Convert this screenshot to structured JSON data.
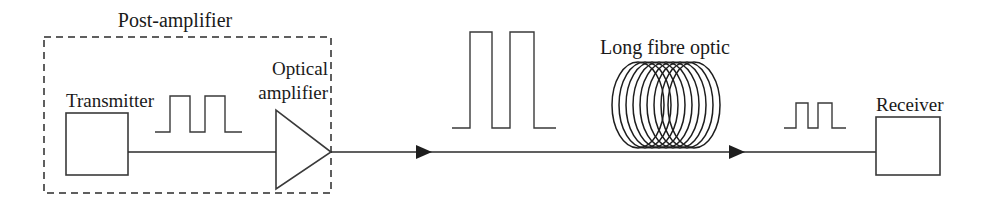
{
  "diagram": {
    "background_color": "#ffffff",
    "line_color": "#2b2b2b",
    "text_color": "#1a1a1a",
    "labels": {
      "post_amplifier": "Post-amplifier",
      "transmitter": "Transmitter",
      "optical_amplifier_line1": "Optical",
      "optical_amplifier_line2": "amplifier",
      "long_fibre_optic": "Long fibre optic",
      "receiver": "Receiver"
    },
    "components": {
      "enclosure": {
        "name": "post-amplifier-boundary",
        "style": "dashed",
        "x": 44,
        "y": 37,
        "width": 287,
        "height": 156
      },
      "transmitter_box": {
        "x": 66,
        "y": 113,
        "width": 62,
        "height": 62
      },
      "amplifier_triangle": {
        "x1": 276,
        "y1": 110,
        "x2": 276,
        "y2": 189,
        "tip_x": 331,
        "tip_y": 152
      },
      "receiver_box": {
        "x": 876,
        "y": 117,
        "width": 64,
        "height": 58
      },
      "fibre_coil": {
        "center_x": 665,
        "center_y": 105,
        "ring_count": 8,
        "ring_rx": 26,
        "ring_ry": 43,
        "spread": 54
      }
    },
    "signal_traces": [
      {
        "name": "input-pulse-train",
        "description": "Low amplitude two-pulse NRZ signal leaving transmitter",
        "baseline_y": 132,
        "peak_y": 96,
        "amplitude": 36,
        "pulse_count": 2,
        "x_start": 155,
        "x_end": 242
      },
      {
        "name": "amplified-pulse-train",
        "description": "High amplitude two-pulse signal after optical amplifier",
        "baseline_y": 128,
        "peak_y": 32,
        "amplitude": 96,
        "pulse_count": 2,
        "x_start": 452,
        "x_end": 556
      },
      {
        "name": "attenuated-pulse-train",
        "description": "Reduced amplitude two-pulse signal arriving at receiver",
        "baseline_y": 128,
        "peak_y": 103,
        "amplitude": 25,
        "pulse_count": 2,
        "x_start": 784,
        "x_end": 846
      }
    ],
    "transmission_line": {
      "y": 152,
      "x_start": 128,
      "x_end": 876,
      "arrow_positions": [
        430,
        743
      ]
    }
  }
}
